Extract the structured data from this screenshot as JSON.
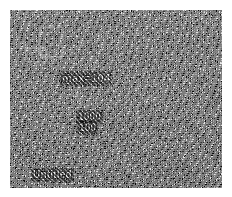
{
  "image": {
    "kind": "dithered-bitmap",
    "description": "1-bit halftone / error-diffusion dithered grayscale bitmap",
    "canvas": {
      "width": 232,
      "height": 197,
      "content_left": 10,
      "content_top": 10,
      "content_width": 212,
      "content_height": 178,
      "margin_color": "#ffffff"
    },
    "palette": {
      "ink": "#000000",
      "paper": "#ffffff",
      "overlay_text": "#f0f0f0",
      "overlay_stroke": "#cfcfcf"
    },
    "pattern": {
      "type": "diagonal-checker-halftone",
      "cell_px": 3,
      "angle_deg": 45
    }
  },
  "annotations": {
    "center_label": "max=104",
    "stack_upper": "1000",
    "stack_lower": "100",
    "corner_label": "Untitled"
  },
  "shapes": {
    "boxes": [
      {
        "name": "upper-left-box",
        "x": 40,
        "y": 27,
        "w": 22,
        "h": 30
      },
      {
        "name": "lower-left-box",
        "x": 26,
        "y": 48,
        "w": 20,
        "h": 14
      }
    ],
    "leaders": [
      {
        "name": "center-leader",
        "x1": 74,
        "y1": 86,
        "x2": 82,
        "y2": 108
      },
      {
        "name": "right-leader",
        "x1": 138,
        "y1": 104,
        "x2": 138,
        "y2": 126
      }
    ]
  }
}
